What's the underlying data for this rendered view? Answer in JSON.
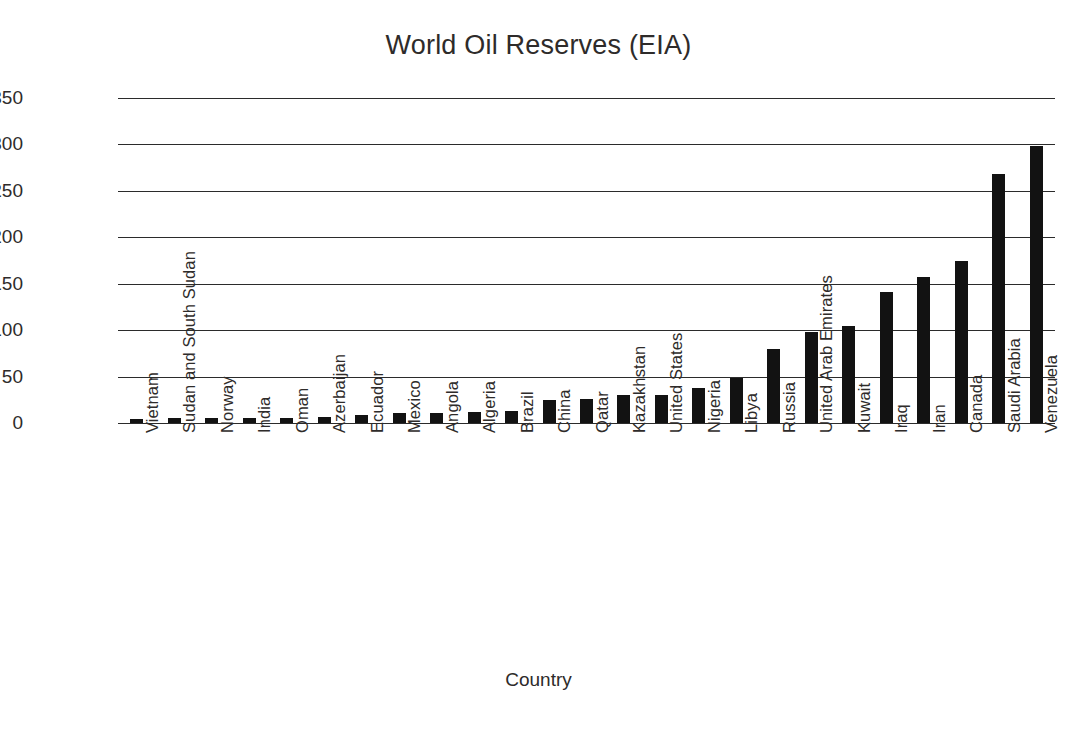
{
  "chart_data": {
    "type": "bar",
    "title": "World Oil Reserves (EIA)",
    "xlabel": "Country",
    "ylabel": "Billion Barrels Oi.",
    "ylim": [
      0,
      350
    ],
    "ytick_step": 50,
    "yticks": [
      350,
      300,
      250,
      200,
      150,
      100,
      50,
      0
    ],
    "grid": true,
    "legend": null,
    "bar_color": "#121212",
    "categories": [
      "Vietnam",
      "Sudan and South Sudan",
      "Norway",
      "India",
      "Oman",
      "Azerbaijan",
      "Ecuador",
      "Mexico",
      "Angola",
      "Algeria",
      "Brazil",
      "China",
      "Qatar",
      "Kazakhstan",
      "United States",
      "Nigeria",
      "Libya",
      "Russia",
      "United Arab Emirates",
      "Kuwait",
      "Iraq",
      "Iran",
      "Canada",
      "Saudi Arabia",
      "Venezuela"
    ],
    "values": [
      4.4,
      5,
      5.4,
      5.5,
      5.5,
      7,
      8.2,
      10.3,
      10.5,
      12.2,
      13.2,
      24.6,
      25.4,
      30,
      30.5,
      37.2,
      48.5,
      80,
      97.8,
      104,
      141,
      157,
      175,
      268,
      298
    ]
  },
  "axis": {
    "y_title": "Billion Barrels Oi.",
    "x_title": "Country"
  }
}
